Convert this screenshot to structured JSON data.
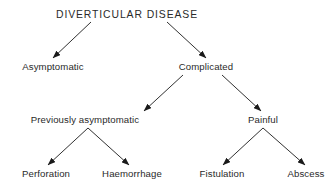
{
  "diagram": {
    "type": "tree",
    "colors": {
      "text": "#2a2a2a",
      "edge": "#1a1a1a",
      "background": "#ffffff"
    },
    "nodes": {
      "root": {
        "label": "DIVERTICULAR DISEASE",
        "x": 127,
        "y": 9
      },
      "asymptomatic": {
        "label": "Asymptomatic",
        "x": 53,
        "y": 61
      },
      "complicated": {
        "label": "Complicated",
        "x": 206,
        "y": 61
      },
      "previously_asymptomatic": {
        "label": "Previously asymptomatic",
        "x": 85,
        "y": 114
      },
      "painful": {
        "label": "Painful",
        "x": 263,
        "y": 114
      },
      "perforation": {
        "label": "Perforation",
        "x": 46,
        "y": 168
      },
      "haemorrhage": {
        "label": "Haemorrhage",
        "x": 132,
        "y": 168
      },
      "fistulation": {
        "label": "Fistulation",
        "x": 222,
        "y": 168
      },
      "abscess": {
        "label": "Abscess",
        "x": 306,
        "y": 168
      }
    },
    "edges": [
      {
        "from": "root",
        "to": "asymptomatic",
        "x1": 91,
        "y1": 22,
        "x2": 53,
        "y2": 58
      },
      {
        "from": "root",
        "to": "complicated",
        "x1": 167,
        "y1": 22,
        "x2": 206,
        "y2": 58
      },
      {
        "from": "complicated",
        "to": "previously_asymptomatic",
        "x1": 183,
        "y1": 75,
        "x2": 144,
        "y2": 111
      },
      {
        "from": "complicated",
        "to": "painful",
        "x1": 222,
        "y1": 75,
        "x2": 261,
        "y2": 111
      },
      {
        "from": "previously_asymptomatic",
        "to": "perforation",
        "x1": 88,
        "y1": 128,
        "x2": 48,
        "y2": 165
      },
      {
        "from": "previously_asymptomatic",
        "to": "haemorrhage",
        "x1": 88,
        "y1": 128,
        "x2": 129,
        "y2": 165
      },
      {
        "from": "painful",
        "to": "fistulation",
        "x1": 263,
        "y1": 128,
        "x2": 223,
        "y2": 165
      },
      {
        "from": "painful",
        "to": "abscess",
        "x1": 263,
        "y1": 128,
        "x2": 305,
        "y2": 165
      }
    ]
  }
}
